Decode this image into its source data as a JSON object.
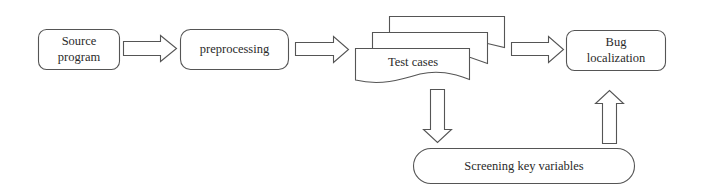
{
  "diagram": {
    "type": "flowchart",
    "nodes": {
      "source": {
        "line1": "Source",
        "line2": "program",
        "shape": "rounded-rect"
      },
      "preprocessing": {
        "label": "preprocessing",
        "shape": "rounded-rect"
      },
      "test_cases": {
        "label": "Test cases",
        "shape": "multi-document"
      },
      "bug_localization": {
        "line1": "Bug",
        "line2": "localization",
        "shape": "rounded-rect"
      },
      "screening": {
        "label": "Screening key variables",
        "shape": "pill"
      }
    },
    "edges": [
      {
        "from": "source",
        "to": "preprocessing",
        "style": "block-arrow-right"
      },
      {
        "from": "preprocessing",
        "to": "test_cases",
        "style": "block-arrow-right"
      },
      {
        "from": "test_cases",
        "to": "bug_localization",
        "style": "block-arrow-right"
      },
      {
        "from": "test_cases",
        "to": "screening",
        "style": "block-arrow-down"
      },
      {
        "from": "screening",
        "to": "bug_localization",
        "style": "block-arrow-up"
      }
    ],
    "colors": {
      "stroke": "#555555",
      "text": "#2a2a2a",
      "background": "#ffffff"
    }
  }
}
